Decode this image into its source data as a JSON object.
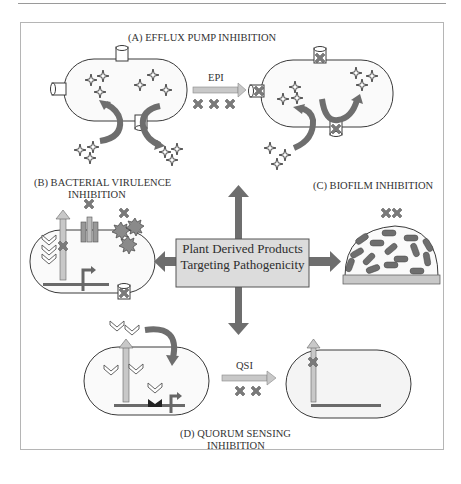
{
  "figure": {
    "central_box": {
      "line1": "Plant Derived Products",
      "line2": "Targeting Pathogenicity"
    },
    "panels": [
      {
        "id": "A",
        "title": "(A) EFFLUX PUMP INHIBITION",
        "arrow_label": "EPI"
      },
      {
        "id": "B",
        "title_line1": "(B) BACTERIAL VIRULENCE",
        "title_line2": "INHIBITION"
      },
      {
        "id": "C",
        "title": "(C) BIOFILM INHIBITION"
      },
      {
        "id": "D",
        "title_line1": "(D) QUORUM SENSING",
        "title_line2": "INHIBITION",
        "arrow_label": "QSI"
      }
    ],
    "colors": {
      "cell_fill": "#f4f4f4",
      "cell_stroke": "#3a3a3a",
      "arrow_dark": "#6e6e6e",
      "arrow_light": "#c8c8c8",
      "box_fill": "#dcdcdc",
      "inhibitor_x": "#7a7a7a",
      "substrate": "#9a9a9a"
    }
  }
}
